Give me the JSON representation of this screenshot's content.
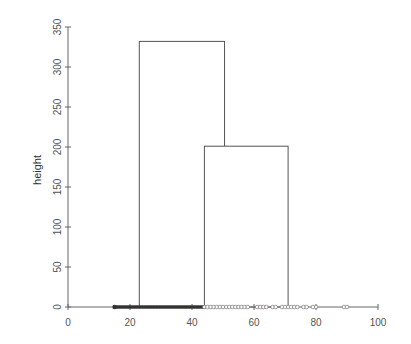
{
  "chart_data": {
    "type": "bar",
    "subtype": "overlapping-histogram-with-rug",
    "title": "",
    "xlabel": "",
    "ylabel": "height",
    "xlim": [
      0,
      100
    ],
    "ylim": [
      0,
      350
    ],
    "x_ticks": [
      0,
      20,
      40,
      60,
      80,
      100
    ],
    "y_ticks": [
      0,
      50,
      100,
      150,
      200,
      250,
      300,
      350
    ],
    "grid": false,
    "legend": null,
    "bars": [
      {
        "name": "bar-1",
        "x_start": 23,
        "x_end": 50.5,
        "height": 332
      },
      {
        "name": "bar-2",
        "x_start": 44,
        "x_end": 71,
        "height": 201
      }
    ],
    "rug": {
      "filled_points": {
        "range": [
          15,
          44
        ],
        "marker": "filled-circle"
      },
      "open_points": [
        44,
        45,
        46,
        47,
        48,
        49,
        50,
        51,
        52,
        53,
        54,
        55,
        56,
        57,
        58,
        61,
        62,
        63,
        64,
        66,
        67,
        69,
        70,
        71,
        72,
        73,
        74,
        76,
        77,
        79,
        80,
        89,
        90
      ]
    },
    "colors": {
      "bar_stroke": "#555555",
      "bar_fill": "#ffffff",
      "axis": "#666666",
      "rug": "#333333"
    }
  }
}
